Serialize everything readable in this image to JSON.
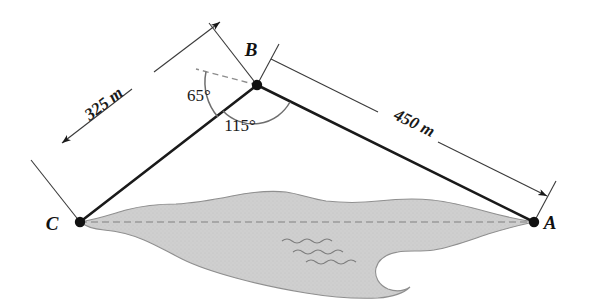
{
  "figure": {
    "background_color": "#ffffff",
    "vertices": [
      {
        "id": "A",
        "label": "A",
        "x": 534,
        "y": 222,
        "label_x": 548,
        "label_y": 229
      },
      {
        "id": "B",
        "label": "B",
        "x": 257,
        "y": 85,
        "label_x": 251,
        "label_y": 56
      },
      {
        "id": "C",
        "label": "C",
        "x": 80,
        "y": 222,
        "label_x": 52,
        "label_y": 230
      }
    ],
    "sides": [
      {
        "id": "CB",
        "label": "325 m",
        "from": "C",
        "to": "B",
        "label_x": 107,
        "label_y": 108,
        "label_rotation": -37
      },
      {
        "id": "BA",
        "label": "450 m",
        "from": "B",
        "to": "A",
        "label_x": 412,
        "label_y": 128,
        "label_rotation": 26
      }
    ],
    "angles": [
      {
        "id": "bearing",
        "label": "65°",
        "label_x": 199,
        "label_y": 101,
        "vertex": "B",
        "note": "angle from dashed horizontal reference to side BC"
      },
      {
        "id": "interior-B",
        "label": "115°",
        "label_x": 238,
        "label_y": 129,
        "vertex": "B",
        "note": "interior angle CBA"
      }
    ],
    "lake": {
      "name": "lake",
      "fill_color": "#cccccc",
      "stroke_color": "#8a8a8a",
      "wave_marks": 3
    },
    "baseline": {
      "id": "CA",
      "style": "dashed",
      "color": "#9a9a9a",
      "note": "dashed line from C to A across the lake"
    },
    "stroke_color": "#1a1a1a"
  }
}
